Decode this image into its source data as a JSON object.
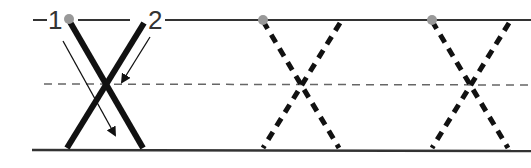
{
  "diagram": {
    "title": "",
    "letter": "X",
    "stroke_labels": [
      {
        "id": "1",
        "text": "1"
      },
      {
        "id": "2",
        "text": "2"
      }
    ],
    "guidelines": [
      "top-line",
      "midline-dashed",
      "baseline"
    ],
    "examples": [
      {
        "style": "solid",
        "with_arrows": true
      },
      {
        "style": "dashed-trace",
        "with_arrows": false
      },
      {
        "style": "dashed-trace",
        "with_arrows": false
      }
    ],
    "colors": {
      "stroke": "#111111",
      "guide": "#333333",
      "midline": "#666666",
      "start_dot": "#999999"
    }
  }
}
